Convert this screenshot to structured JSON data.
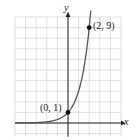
{
  "chart_data": {
    "type": "line",
    "title": "",
    "xlabel": "x",
    "ylabel": "y",
    "function": "y = 3^x",
    "x": [
      -5,
      -4,
      -3,
      -2,
      -1,
      0,
      1,
      2
    ],
    "series": [
      {
        "name": "y = 3^x",
        "values": [
          0.004,
          0.012,
          0.037,
          0.111,
          0.333,
          1,
          3,
          9
        ]
      }
    ],
    "annotations": [
      {
        "point": [
          0,
          1
        ],
        "label": "(0, 1)"
      },
      {
        "point": [
          2,
          9
        ],
        "label": "(2, 9)"
      }
    ],
    "xlim": [
      -5,
      5
    ],
    "ylim": [
      -1,
      10
    ],
    "grid": true,
    "legend": "none"
  },
  "labels": {
    "y_axis": "y",
    "x_axis": "x",
    "point_origin": "(0, 1)",
    "point_top": "(2, 9)"
  },
  "colors": {
    "grid": "#d8d8d8",
    "axis": "#222222",
    "curve": "#555555",
    "point": "#111111"
  }
}
